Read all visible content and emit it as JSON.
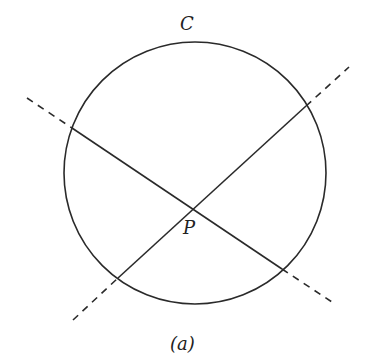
{
  "figure": {
    "circle_label": "C",
    "point_label": "P",
    "caption": "(a)",
    "stroke_color": "#2a2a2a",
    "background": "#ffffff"
  },
  "geometry": {
    "circle": {
      "cx": 195,
      "cy": 173,
      "r": 131
    },
    "point_P": {
      "x": 192,
      "y": 208
    },
    "chord_1": {
      "x1": 72,
      "y1": 128,
      "x2": 282,
      "y2": 269
    },
    "chord_1_ext_a": {
      "x1": 27,
      "y1": 98,
      "x2": 72,
      "y2": 128
    },
    "chord_1_ext_b": {
      "x1": 282,
      "y1": 269,
      "x2": 335,
      "y2": 304
    },
    "chord_2": {
      "x1": 118,
      "y1": 278,
      "x2": 306,
      "y2": 106
    },
    "chord_2_ext_a": {
      "x1": 73,
      "y1": 320,
      "x2": 118,
      "y2": 278
    },
    "chord_2_ext_b": {
      "x1": 306,
      "y1": 106,
      "x2": 349,
      "y2": 67
    }
  }
}
